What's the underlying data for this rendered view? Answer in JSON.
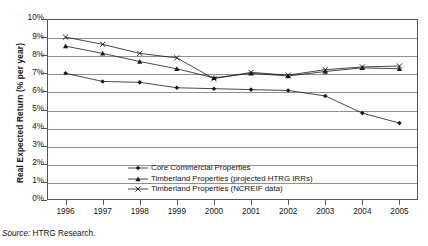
{
  "figure": {
    "source_prefix": "Source:",
    "source_text": "HTRG Research."
  },
  "chart_data": {
    "type": "line",
    "title": "",
    "xlabel": "",
    "ylabel": "Real Expected Return (% per year)",
    "categories": [
      "1996",
      "1997",
      "1998",
      "1999",
      "2000",
      "2001",
      "2002",
      "2003",
      "2004",
      "2005"
    ],
    "x": [
      1996,
      1997,
      1998,
      1999,
      2000,
      2001,
      2002,
      2003,
      2004,
      2005
    ],
    "ylim": [
      0,
      10
    ],
    "ytick_labels": [
      "0%",
      "1%",
      "2%",
      "3%",
      "4%",
      "5%",
      "6%",
      "7%",
      "8%",
      "9%",
      "10%"
    ],
    "ytick_values": [
      0,
      1,
      2,
      3,
      4,
      5,
      6,
      7,
      8,
      9,
      10
    ],
    "ytick_suffix": "%",
    "grid": true,
    "grid_axis": "y",
    "legend_position": "inside-bottom-center",
    "series": [
      {
        "name": "Core Commercial Properties",
        "marker": "diamond",
        "color": "#1a1a1a",
        "values": [
          7.0,
          6.55,
          6.5,
          6.2,
          6.15,
          6.1,
          6.05,
          5.75,
          4.8,
          4.25
        ]
      },
      {
        "name": "Timberland Properties (projected HTRG IRRs)",
        "marker": "triangle",
        "color": "#1a1a1a",
        "values": [
          8.5,
          8.1,
          7.65,
          7.25,
          6.75,
          7.0,
          6.85,
          7.1,
          7.3,
          7.25
        ]
      },
      {
        "name": "Timberland Properties (NCREIF data)",
        "marker": "cross",
        "color": "#1a1a1a",
        "values": [
          9.0,
          8.6,
          8.1,
          7.85,
          6.7,
          7.05,
          6.9,
          7.2,
          7.35,
          7.4
        ]
      }
    ]
  }
}
